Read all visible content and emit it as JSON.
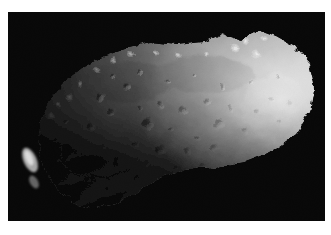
{
  "page": {
    "kind": "photograph",
    "background_color": "#ffffff",
    "width": 331,
    "height": 235
  },
  "photo": {
    "subject_name": "asteroid-gaspra",
    "caption": "",
    "alt_text": "Grayscale spacecraft photograph of an irregular, heavily cratered asteroid lit from the right against a black starless sky",
    "frame": {
      "x": 8,
      "y": 12,
      "width": 317,
      "height": 209,
      "background_color": "#000000"
    },
    "palette": {
      "space_black": "#000000",
      "terminator_dark": "#141414",
      "shadow_gray": "#3a3a3a",
      "mid_gray": "#8d8d8d",
      "light_gray": "#c2c2c2",
      "highlight": "#efefef",
      "limb_white": "#fafafa"
    },
    "lighting": {
      "illumination_direction": "right",
      "terminator_edge": "upper-left",
      "brightest_region": "right-limb"
    },
    "body_outline": [
      [
        118,
        36
      ],
      [
        142,
        30
      ],
      [
        168,
        33
      ],
      [
        196,
        30
      ],
      [
        214,
        22
      ],
      [
        232,
        28
      ],
      [
        252,
        18
      ],
      [
        268,
        24
      ],
      [
        286,
        34
      ],
      [
        300,
        52
      ],
      [
        306,
        76
      ],
      [
        302,
        100
      ],
      [
        288,
        122
      ],
      [
        262,
        140
      ],
      [
        236,
        150
      ],
      [
        206,
        155
      ],
      [
        178,
        158
      ],
      [
        150,
        168
      ],
      [
        126,
        182
      ],
      [
        104,
        192
      ],
      [
        84,
        196
      ],
      [
        64,
        190
      ],
      [
        48,
        176
      ],
      [
        36,
        156
      ],
      [
        30,
        134
      ],
      [
        32,
        112
      ],
      [
        40,
        92
      ],
      [
        54,
        72
      ],
      [
        74,
        56
      ],
      [
        96,
        44
      ]
    ],
    "detached_fragment": {
      "name": "left-bright-sliver",
      "cx": 22,
      "cy": 148,
      "rx": 7,
      "ry": 14,
      "rotation": -24
    },
    "craters": [
      {
        "cx": 92,
        "cy": 86,
        "r": 5.0,
        "depth": 0.55
      },
      {
        "cx": 104,
        "cy": 100,
        "r": 3.2,
        "depth": 0.45
      },
      {
        "cx": 118,
        "cy": 76,
        "r": 4.0,
        "depth": 0.5
      },
      {
        "cx": 131,
        "cy": 96,
        "r": 2.6,
        "depth": 0.4
      },
      {
        "cx": 140,
        "cy": 112,
        "r": 6.0,
        "depth": 0.6
      },
      {
        "cx": 152,
        "cy": 92,
        "r": 3.4,
        "depth": 0.45
      },
      {
        "cx": 163,
        "cy": 118,
        "r": 2.8,
        "depth": 0.4
      },
      {
        "cx": 176,
        "cy": 100,
        "r": 4.6,
        "depth": 0.52
      },
      {
        "cx": 188,
        "cy": 124,
        "r": 3.0,
        "depth": 0.42
      },
      {
        "cx": 199,
        "cy": 90,
        "r": 3.8,
        "depth": 0.46
      },
      {
        "cx": 212,
        "cy": 112,
        "r": 5.2,
        "depth": 0.55
      },
      {
        "cx": 224,
        "cy": 96,
        "r": 2.9,
        "depth": 0.4
      },
      {
        "cx": 236,
        "cy": 120,
        "r": 3.6,
        "depth": 0.44
      },
      {
        "cx": 248,
        "cy": 100,
        "r": 4.2,
        "depth": 0.48
      },
      {
        "cx": 262,
        "cy": 88,
        "r": 3.1,
        "depth": 0.4
      },
      {
        "cx": 272,
        "cy": 110,
        "r": 2.5,
        "depth": 0.36
      },
      {
        "cx": 84,
        "cy": 116,
        "r": 4.4,
        "depth": 0.5
      },
      {
        "cx": 96,
        "cy": 134,
        "r": 3.0,
        "depth": 0.42
      },
      {
        "cx": 110,
        "cy": 150,
        "r": 4.8,
        "depth": 0.52
      },
      {
        "cx": 126,
        "cy": 132,
        "r": 2.7,
        "depth": 0.38
      },
      {
        "cx": 138,
        "cy": 152,
        "r": 3.5,
        "depth": 0.44
      },
      {
        "cx": 152,
        "cy": 138,
        "r": 5.4,
        "depth": 0.56
      },
      {
        "cx": 166,
        "cy": 156,
        "r": 2.6,
        "depth": 0.36
      },
      {
        "cx": 180,
        "cy": 140,
        "r": 3.9,
        "depth": 0.46
      },
      {
        "cx": 196,
        "cy": 154,
        "r": 3.0,
        "depth": 0.4
      },
      {
        "cx": 208,
        "cy": 136,
        "r": 4.1,
        "depth": 0.48
      },
      {
        "cx": 70,
        "cy": 140,
        "r": 3.3,
        "depth": 0.44
      },
      {
        "cx": 62,
        "cy": 160,
        "r": 2.8,
        "depth": 0.38
      },
      {
        "cx": 80,
        "cy": 168,
        "r": 3.6,
        "depth": 0.44
      },
      {
        "cx": 100,
        "cy": 176,
        "r": 2.4,
        "depth": 0.34
      },
      {
        "cx": 128,
        "cy": 166,
        "r": 2.2,
        "depth": 0.32
      },
      {
        "cx": 144,
        "cy": 176,
        "r": 2.0,
        "depth": 0.3
      },
      {
        "cx": 158,
        "cy": 168,
        "r": 2.4,
        "depth": 0.34
      },
      {
        "cx": 106,
        "cy": 64,
        "r": 2.6,
        "depth": 0.4
      },
      {
        "cx": 132,
        "cy": 60,
        "r": 2.2,
        "depth": 0.36
      },
      {
        "cx": 160,
        "cy": 70,
        "r": 2.8,
        "depth": 0.38
      },
      {
        "cx": 186,
        "cy": 66,
        "r": 2.4,
        "depth": 0.34
      },
      {
        "cx": 214,
        "cy": 74,
        "r": 3.0,
        "depth": 0.4
      },
      {
        "cx": 244,
        "cy": 72,
        "r": 2.3,
        "depth": 0.32
      },
      {
        "cx": 268,
        "cy": 66,
        "r": 2.0,
        "depth": 0.3
      },
      {
        "cx": 282,
        "cy": 92,
        "r": 2.6,
        "depth": 0.34
      },
      {
        "cx": 56,
        "cy": 110,
        "r": 2.8,
        "depth": 0.4
      },
      {
        "cx": 48,
        "cy": 128,
        "r": 2.4,
        "depth": 0.36
      }
    ],
    "bright_peaks": [
      {
        "cx": 60,
        "cy": 86,
        "r": 2.6
      },
      {
        "cx": 72,
        "cy": 72,
        "r": 2.2
      },
      {
        "cx": 88,
        "cy": 58,
        "r": 2.4
      },
      {
        "cx": 104,
        "cy": 48,
        "r": 2.0
      },
      {
        "cx": 124,
        "cy": 42,
        "r": 2.2
      },
      {
        "cx": 148,
        "cy": 40,
        "r": 1.8
      },
      {
        "cx": 172,
        "cy": 44,
        "r": 2.0
      },
      {
        "cx": 198,
        "cy": 42,
        "r": 1.9
      },
      {
        "cx": 226,
        "cy": 36,
        "r": 2.4
      },
      {
        "cx": 238,
        "cy": 30,
        "r": 2.8
      },
      {
        "cx": 248,
        "cy": 44,
        "r": 3.2
      },
      {
        "cx": 256,
        "cy": 26,
        "r": 2.0
      },
      {
        "cx": 44,
        "cy": 104,
        "r": 2.2
      },
      {
        "cx": 38,
        "cy": 122,
        "r": 1.8
      },
      {
        "cx": 52,
        "cy": 92,
        "r": 1.6
      }
    ]
  }
}
